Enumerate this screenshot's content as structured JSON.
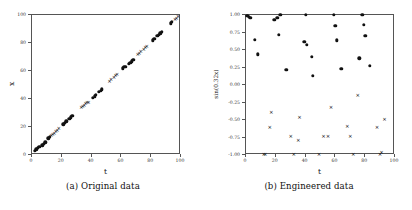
{
  "figure": {
    "panels": [
      {
        "id": "a",
        "caption": "(a) Original data",
        "chart_data": {
          "type": "scatter",
          "title": "",
          "xlabel": "t",
          "ylabel": "x",
          "xlim": [
            0,
            100
          ],
          "ylim": [
            0,
            100
          ],
          "xticks": [
            0,
            20,
            40,
            60,
            80,
            100
          ],
          "yticks": [
            0,
            20,
            40,
            60,
            80,
            100
          ],
          "xticklabels": [
            "0",
            "20",
            "40",
            "60",
            "80",
            "100"
          ],
          "yticklabels": [
            "0",
            "20",
            "40",
            "60",
            "80",
            "100"
          ],
          "grid": false,
          "legend": "none",
          "series": [
            {
              "name": "dot-group",
              "marker": "filled-circle",
              "points": [
                [
                  2,
                  3
                ],
                [
                  3,
                  4
                ],
                [
                  4,
                  5
                ],
                [
                  5,
                  6
                ],
                [
                  7,
                  7
                ],
                [
                  8,
                  8
                ],
                [
                  9,
                  9
                ],
                [
                  11,
                  12
                ],
                [
                  12,
                  13
                ],
                [
                  21,
                  22
                ],
                [
                  22,
                  23
                ],
                [
                  23,
                  24
                ],
                [
                  25,
                  26
                ],
                [
                  26,
                  27
                ],
                [
                  27,
                  28
                ],
                [
                  41,
                  41
                ],
                [
                  42,
                  42
                ],
                [
                  43,
                  43
                ],
                [
                  45,
                  45
                ],
                [
                  46,
                  46
                ],
                [
                  47,
                  47
                ],
                [
                  61,
                  62
                ],
                [
                  62,
                  63
                ],
                [
                  63,
                  63
                ],
                [
                  65,
                  65
                ],
                [
                  66,
                  66
                ],
                [
                  67,
                  67
                ],
                [
                  68,
                  68
                ],
                [
                  81,
                  82
                ],
                [
                  82,
                  83
                ],
                [
                  84,
                  85
                ],
                [
                  85,
                  86
                ],
                [
                  86,
                  87
                ],
                [
                  87,
                  88
                ],
                [
                  93,
                  94
                ],
                [
                  94,
                  95
                ]
              ]
            },
            {
              "name": "cross-group",
              "marker": "cross",
              "points": [
                [
                  13,
                  14
                ],
                [
                  14,
                  15
                ],
                [
                  15,
                  16
                ],
                [
                  16,
                  17
                ],
                [
                  17,
                  18
                ],
                [
                  18,
                  19
                ],
                [
                  33,
                  34
                ],
                [
                  34,
                  35
                ],
                [
                  35,
                  36
                ],
                [
                  36,
                  37
                ],
                [
                  37,
                  38
                ],
                [
                  38,
                  38
                ],
                [
                  52,
                  53
                ],
                [
                  53,
                  54
                ],
                [
                  55,
                  56
                ],
                [
                  56,
                  57
                ],
                [
                  57,
                  58
                ],
                [
                  71,
                  72
                ],
                [
                  72,
                  73
                ],
                [
                  73,
                  74
                ],
                [
                  75,
                  76
                ],
                [
                  76,
                  77
                ],
                [
                  77,
                  78
                ],
                [
                  96,
                  97
                ],
                [
                  97,
                  98
                ],
                [
                  98,
                  99
                ]
              ]
            }
          ]
        }
      },
      {
        "id": "b",
        "caption": "(b) Engineered data",
        "chart_data": {
          "type": "scatter",
          "title": "",
          "xlabel": "t",
          "ylabel": "sin(0.32x)",
          "xlim": [
            0,
            100
          ],
          "ylim": [
            -1.0,
            1.0
          ],
          "xticks": [
            0,
            20,
            40,
            60,
            80,
            100
          ],
          "yticks": [
            1.0,
            0.75,
            0.5,
            0.25,
            0.0,
            -0.25,
            -0.5,
            -0.75,
            -1.0
          ],
          "xticklabels": [
            "0",
            "20",
            "40",
            "60",
            "80",
            "100"
          ],
          "yticklabels": [
            "1.00",
            "0.75",
            "0.50",
            "0.25",
            "0.00",
            "-0.25",
            "-0.50",
            "-0.75",
            "-1.00"
          ],
          "grid": false,
          "legend": "none",
          "series": [
            {
              "name": "positive-dots",
              "marker": "filled-circle",
              "points": [
                [
                  1,
                  0.99
                ],
                [
                  2,
                  0.97
                ],
                [
                  3,
                  0.96
                ],
                [
                  6,
                  0.65
                ],
                [
                  8,
                  0.44
                ],
                [
                  19,
                  0.93
                ],
                [
                  21,
                  0.96
                ],
                [
                  23,
                  1.0
                ],
                [
                  22,
                  0.72
                ],
                [
                  27,
                  0.22
                ],
                [
                  40,
                  1.0
                ],
                [
                  39,
                  0.62
                ],
                [
                  41,
                  0.57
                ],
                [
                  44,
                  0.4
                ],
                [
                  45,
                  0.13
                ],
                [
                  59,
                  1.0
                ],
                [
                  60,
                  0.85
                ],
                [
                  61,
                  0.64
                ],
                [
                  64,
                  0.23
                ],
                [
                  78,
                  1.0
                ],
                [
                  79,
                  0.86
                ],
                [
                  80,
                  0.7
                ],
                [
                  83,
                  0.27
                ],
                [
                  76,
                  0.38
                ]
              ]
            },
            {
              "name": "negative-crosses",
              "marker": "cross",
              "points": [
                [
                  12,
                  -0.98
                ],
                [
                  13,
                  -0.99
                ],
                [
                  17,
                  -0.38
                ],
                [
                  16,
                  -0.6
                ],
                [
                  30,
                  -0.73
                ],
                [
                  32,
                  -0.98
                ],
                [
                  35,
                  -0.79
                ],
                [
                  36,
                  -0.45
                ],
                [
                  49,
                  -0.98
                ],
                [
                  52,
                  -0.73
                ],
                [
                  55,
                  -0.73
                ],
                [
                  57,
                  -0.32
                ],
                [
                  68,
                  -0.58
                ],
                [
                  70,
                  -0.73
                ],
                [
                  72,
                  -0.98
                ],
                [
                  75,
                  -0.14
                ],
                [
                  88,
                  -0.6
                ],
                [
                  90,
                  -0.98
                ],
                [
                  91,
                  -0.95
                ],
                [
                  93,
                  -0.49
                ]
              ]
            }
          ]
        }
      }
    ]
  }
}
